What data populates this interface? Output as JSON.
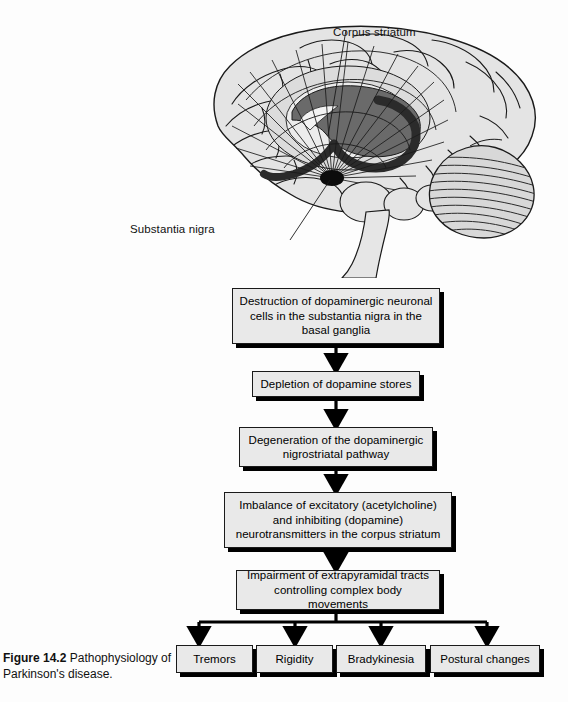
{
  "figure": {
    "number_label": "Figure 14.2",
    "caption_text": "Pathophysiology of Parkinson's disease.",
    "full_caption": "Figure 14.2 Pathophysiology of Parkinson's disease."
  },
  "illustration": {
    "name": "sagittal-brain-section",
    "labels": [
      {
        "id": "corpus-striatum",
        "text": "Corpus striatum"
      },
      {
        "id": "substantia-nigra",
        "text": "Substantia nigra"
      }
    ],
    "colors": {
      "cortex_fill": "#e3e3e3",
      "cortex_shade": "#d2d2d2",
      "striatum_dark": "#5e5e5e",
      "striatum_ring": "#2b2b2b",
      "substantia_nigra": "#101010",
      "outline": "#1a1a1a"
    }
  },
  "flowchart": {
    "type": "vertical-cascade-with-branch",
    "steps": [
      {
        "id": "destruction",
        "text": "Destruction of dopaminergic neuronal cells in the substantia nigra in the basal ganglia"
      },
      {
        "id": "depletion",
        "text": "Depletion of dopamine stores"
      },
      {
        "id": "degeneration",
        "text": "Degeneration of the dopaminergic nigrostriatal pathway"
      },
      {
        "id": "imbalance",
        "text": "Imbalance of excitatory (acetylcholine) and inhibiting (dopamine) neurotransmitters in the corpus striatum"
      },
      {
        "id": "impairment",
        "text": "Impairment of extrapyramidal tracts controlling complex body movements"
      }
    ],
    "outcomes": [
      {
        "id": "tremors",
        "text": "Tremors"
      },
      {
        "id": "rigidity",
        "text": "Rigidity"
      },
      {
        "id": "bradykinesia",
        "text": "Bradykinesia"
      },
      {
        "id": "postural",
        "text": "Postural changes"
      }
    ],
    "colors": {
      "box_fill": "#e9e9e9",
      "box_border": "#1a1a1a",
      "box_shadow": "#000000",
      "arrow": "#000000"
    }
  },
  "page": {
    "background": "#fdfdfd",
    "width": 568,
    "height": 702
  }
}
